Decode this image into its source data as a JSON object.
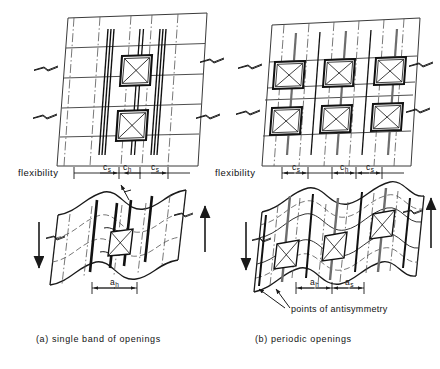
{
  "figure": {
    "title_a": "(a)  single   band  of  openings",
    "title_b": "(b)  periodic   openings",
    "annotation_antisymmetry": "points of antisymmetry",
    "panels": [
      {
        "id": "panel-a",
        "caption": "(a)  single   band  of  openings",
        "flexibility_label": "flexibility",
        "openings_rows": 2,
        "openings_cols": 1,
        "upper_dimensions": [
          {
            "name": "c_s",
            "symbol": "c",
            "subscript": "s"
          },
          {
            "name": "c_h",
            "symbol": "c",
            "subscript": "h"
          },
          {
            "name": "c_s",
            "symbol": "c",
            "subscript": "s"
          }
        ],
        "lower_dimensions": [
          {
            "name": "a_h",
            "symbol": "a",
            "subscript": "h"
          }
        ]
      },
      {
        "id": "panel-b",
        "caption": "(b)  periodic   openings",
        "flexibility_label": "flexibility",
        "openings_rows": 2,
        "openings_cols": 3,
        "upper_dimensions": [
          {
            "name": "c_s",
            "symbol": "c",
            "subscript": "s"
          },
          {
            "name": "c_h",
            "symbol": "c",
            "subscript": "h"
          },
          {
            "name": "c_s",
            "symbol": "c",
            "subscript": "s"
          }
        ],
        "lower_dimensions": [
          {
            "name": "a_h",
            "symbol": "a",
            "subscript": "h"
          },
          {
            "name": "a_s",
            "symbol": "a",
            "subscript": "s"
          }
        ]
      }
    ],
    "colors": {
      "ink": "#1a1a1a",
      "thin_line": "#3a3a3a",
      "dash_dot": "#555555",
      "heavy_line": "#111111",
      "background": "#ffffff"
    }
  },
  "labels": {
    "flexibility_a": "flexibility",
    "flexibility_b": "flexibility",
    "cs_a_left": "c",
    "cs_a_left_sub": "s",
    "ch_a": "c",
    "ch_a_sub": "h",
    "cs_a_right": "c",
    "cs_a_right_sub": "s",
    "cs_b_left": "c",
    "cs_b_left_sub": "s",
    "ch_b": "c",
    "ch_b_sub": "h",
    "cs_b_right": "c",
    "cs_b_right_sub": "s",
    "ah_a": "a",
    "ah_a_sub": "h",
    "ah_b": "a",
    "ah_b_sub": "h",
    "as_b": "a",
    "as_b_sub": "s",
    "antisymmetry": "points of antisymmetry",
    "caption_a": "(a)  single   band  of  openings",
    "caption_b": "(b)  periodic   openings"
  }
}
